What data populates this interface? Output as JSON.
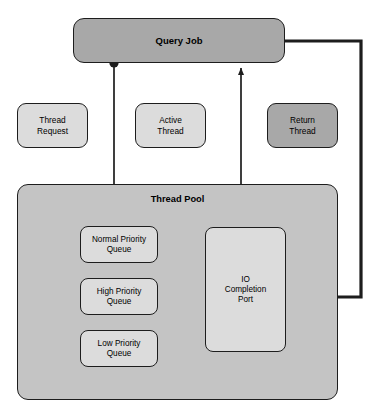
{
  "diagram": {
    "colors": {
      "mid_gray": "#a8a8a8",
      "light_gray": "#dcdcdc",
      "pool_gray": "#c4c4c4",
      "stroke": "#1d1d1d",
      "background": "#ffffff"
    }
  },
  "query_job": {
    "label": "Query Job"
  },
  "legend": {
    "thread_request": {
      "line1": "Thread",
      "line2": "Request",
      "fill": "#dcdcdc"
    },
    "active_thread": {
      "line1": "Active",
      "line2": "Thread",
      "fill": "#dcdcdc"
    },
    "return_thread": {
      "line1": "Return",
      "line2": "Thread",
      "fill": "#a8a8a8"
    }
  },
  "thread_pool": {
    "label": "Thread Pool",
    "queues": [
      {
        "line1": "Normal Priority",
        "line2": "Queue"
      },
      {
        "line1": "High Priority",
        "line2": "Queue"
      },
      {
        "line1": "Low Priority",
        "line2": "Queue"
      }
    ],
    "io_completion_port": {
      "line1": "IO",
      "line2": "Completion",
      "line3": "Port"
    }
  },
  "connections": {
    "request_flow": "Query Job to Normal Priority Queue",
    "active_flow": "IO Completion Port to Query Job",
    "queue_bus": "Priority Queues to IO Completion Port",
    "return_flow": "Query Job to IO Completion Port"
  }
}
